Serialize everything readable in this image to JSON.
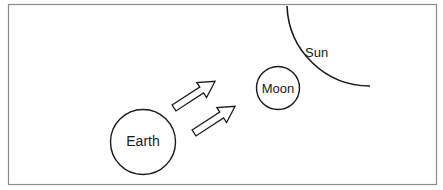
{
  "diagram": {
    "labels": {
      "earth": "Earth",
      "moon": "Moon",
      "sun": "Sun"
    },
    "colors": {
      "stroke": "#1a1a1a",
      "frame": "#8a8a8a",
      "background": "#ffffff"
    },
    "arrows": [
      {
        "name": "light-arrow-1",
        "direction": "toward-moon"
      },
      {
        "name": "light-arrow-2",
        "direction": "toward-moon"
      }
    ]
  }
}
